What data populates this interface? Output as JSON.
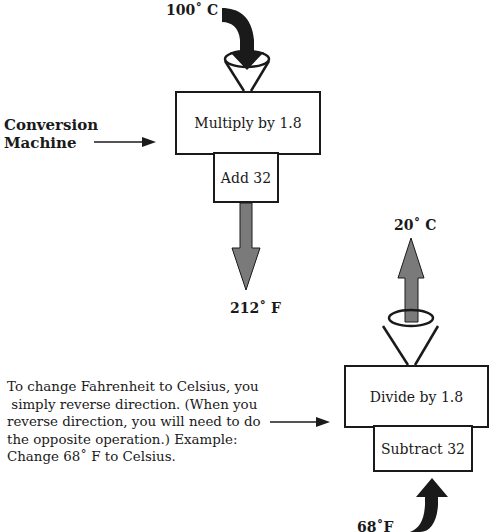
{
  "title": "Conversion Machine",
  "colors": {
    "ink": "#1a1a1a",
    "gray_arrow": "#7a7a7a",
    "dark_arrow": "#1a1a1a",
    "background": "#ffffff"
  },
  "top_machine": {
    "input_label": "100˚ C",
    "steps": [
      "Multiply by 1.8",
      "Add 32"
    ],
    "output_label": "212˚ F",
    "side_label_line1": "Conversion",
    "side_label_line2": "Machine"
  },
  "bottom_machine": {
    "input_label": "68˚F",
    "steps": [
      "Divide by 1.8",
      "Subtract 32"
    ],
    "output_label": "20˚ C"
  },
  "explanation": {
    "lines": [
      "To change Fahrenheit to Celsius, you",
      " simply reverse direction. (When you",
      "reverse direction, you will need to do",
      "the opposite operation.) Example:",
      "Change 68˚ F to Celsius."
    ]
  }
}
